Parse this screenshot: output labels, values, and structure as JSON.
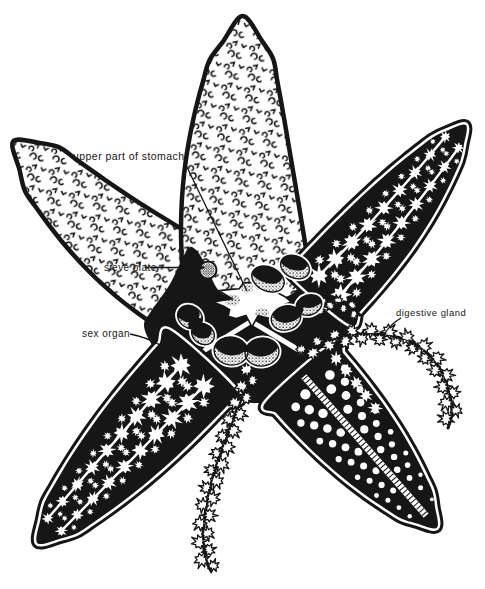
{
  "labels": {
    "upper_part_of_stomach": "upper part of stomach",
    "sieve_plate": "sieve plate",
    "anus": "anus",
    "sex_organ": "sex organ",
    "digestive_gland": "digestive gland"
  },
  "colors": {
    "ink": "#161616",
    "paper": "#ffffff"
  }
}
